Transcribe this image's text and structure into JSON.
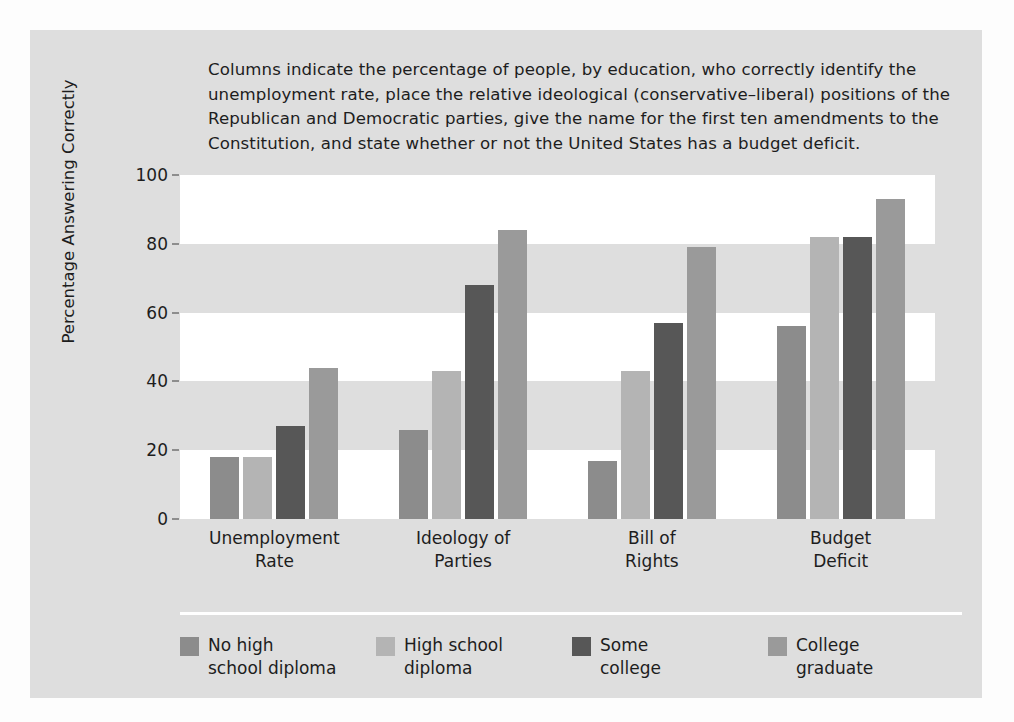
{
  "caption": "Columns indicate the percentage of people, by education, who correctly identify the\nunemployment rate, place the relative ideological (conservative–liberal) positions of the\nRepublican and Democratic parties, give the name for the first ten amendments to the\nConstitution, and state whether or not the United States has a budget deficit.",
  "colors": {
    "panel_background": "#dedede",
    "band_light": "#ffffff",
    "band_gray": "#dedede",
    "text": "#1d1d1d",
    "series": [
      "#8c8c8c",
      "#b4b4b4",
      "#575757",
      "#9a9a9a"
    ]
  },
  "chart_data": {
    "type": "bar",
    "title": "",
    "xlabel": "",
    "ylabel": "Percentage Answering Correctly",
    "ylim": [
      0,
      100
    ],
    "yticks": [
      0,
      20,
      40,
      60,
      80,
      100
    ],
    "ytick_labels": [
      "0",
      "20",
      "40",
      "60",
      "80",
      "100"
    ],
    "grid": false,
    "banded_background": true,
    "legend_position": "bottom",
    "categories": [
      "Unemployment\nRate",
      "Ideology of\nParties",
      "Bill of\nRights",
      "Budget\nDeficit"
    ],
    "series": [
      {
        "name": "No high\nschool diploma",
        "color": "#8c8c8c",
        "values": [
          18,
          26,
          17,
          56
        ]
      },
      {
        "name": "High school\ndiploma",
        "color": "#b4b4b4",
        "values": [
          18,
          43,
          43,
          82
        ]
      },
      {
        "name": "Some\ncollege",
        "color": "#575757",
        "values": [
          27,
          68,
          57,
          82
        ]
      },
      {
        "name": "College\ngraduate",
        "color": "#9a9a9a",
        "values": [
          44,
          84,
          79,
          93
        ]
      }
    ]
  }
}
